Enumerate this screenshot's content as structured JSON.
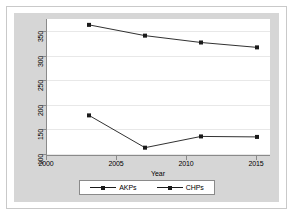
{
  "chart_data": {
    "type": "line",
    "title": "",
    "xlabel": "Year",
    "ylabel": "",
    "x": [
      2003,
      2007,
      2011,
      2015
    ],
    "xlim": [
      2000,
      2016
    ],
    "ylim": [
      95,
      375
    ],
    "xticks": [
      "2000",
      "2005",
      "2010",
      "2015"
    ],
    "xtick_values": [
      2000,
      2005,
      2010,
      2015
    ],
    "yticks": [
      "100",
      "150",
      "200",
      "250",
      "300",
      "350"
    ],
    "ytick_values": [
      100,
      150,
      200,
      250,
      300,
      350
    ],
    "grid": true,
    "legend_position": "bottom",
    "series": [
      {
        "name": "AKPs",
        "values": [
          363,
          341,
          327,
          317
        ],
        "marker": "square",
        "color": "#1a1a1a"
      },
      {
        "name": "CHPs",
        "values": [
          178,
          112,
          135,
          134
        ],
        "marker": "square",
        "color": "#1a1a1a"
      }
    ]
  },
  "legend": {
    "entries": [
      {
        "label": "AKPs"
      },
      {
        "label": "CHPs"
      }
    ]
  },
  "axis": {
    "x_title": "Year"
  },
  "colors": {
    "graph_region": "#d6d6d6",
    "plot_background": "#ffffff",
    "axis_line": "#8a8a8a",
    "gridline": "#e8e8e8",
    "series": "#1a1a1a"
  }
}
